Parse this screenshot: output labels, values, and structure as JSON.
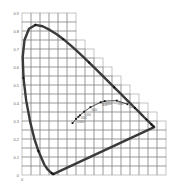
{
  "chart_data": {
    "type": "line",
    "xlabel": "x",
    "ylabel": "y",
    "xlim": [
      0,
      0.8
    ],
    "ylim": [
      0,
      0.9
    ],
    "grid": true,
    "y_ticks": [
      "0",
      "0.1",
      "0.2",
      "0.3",
      "0.4",
      "0.5",
      "0.6",
      "0.7",
      "0.8",
      "0.9"
    ],
    "x_ticks": [
      "0"
    ],
    "series": [
      {
        "name": "Spectral locus",
        "points": [
          [
            0.1741,
            0.005
          ],
          [
            0.173,
            0.0048
          ],
          [
            0.1714,
            0.0051
          ],
          [
            0.1689,
            0.0069
          ],
          [
            0.1644,
            0.0109
          ],
          [
            0.1566,
            0.0177
          ],
          [
            0.144,
            0.0297
          ],
          [
            0.1241,
            0.0578
          ],
          [
            0.0913,
            0.1327
          ],
          [
            0.0687,
            0.2007
          ],
          [
            0.0454,
            0.295
          ],
          [
            0.0235,
            0.4127
          ],
          [
            0.0082,
            0.5384
          ],
          [
            0.0039,
            0.6548
          ],
          [
            0.0139,
            0.7502
          ],
          [
            0.0389,
            0.812
          ],
          [
            0.0743,
            0.8338
          ],
          [
            0.1142,
            0.8262
          ],
          [
            0.1547,
            0.8059
          ],
          [
            0.1929,
            0.7816
          ],
          [
            0.2296,
            0.7543
          ],
          [
            0.2658,
            0.7243
          ],
          [
            0.3016,
            0.6923
          ],
          [
            0.3373,
            0.6589
          ],
          [
            0.3731,
            0.6245
          ],
          [
            0.4087,
            0.5896
          ],
          [
            0.4441,
            0.5547
          ],
          [
            0.4788,
            0.5202
          ],
          [
            0.5125,
            0.4866
          ],
          [
            0.5448,
            0.4544
          ],
          [
            0.5752,
            0.4242
          ],
          [
            0.6029,
            0.3965
          ],
          [
            0.627,
            0.3725
          ],
          [
            0.6482,
            0.3514
          ],
          [
            0.6658,
            0.334
          ],
          [
            0.6801,
            0.3197
          ],
          [
            0.6915,
            0.3083
          ],
          [
            0.7006,
            0.2993
          ],
          [
            0.7079,
            0.292
          ],
          [
            0.714,
            0.2859
          ],
          [
            0.719,
            0.2809
          ],
          [
            0.723,
            0.277
          ],
          [
            0.726,
            0.274
          ],
          [
            0.7283,
            0.2717
          ],
          [
            0.73,
            0.27
          ],
          [
            0.7347,
            0.2653
          ]
        ],
        "closed_with_purple_line": true
      },
      {
        "name": "Planckian locus",
        "points": [
          [
            0.2806,
            0.2883
          ],
          [
            0.3003,
            0.3117
          ],
          [
            0.3135,
            0.3236
          ],
          [
            0.3221,
            0.3318
          ],
          [
            0.3451,
            0.3516
          ],
          [
            0.3805,
            0.3768
          ],
          [
            0.4369,
            0.4041
          ],
          [
            0.4596,
            0.4105
          ],
          [
            0.5267,
            0.4133
          ],
          [
            0.5857,
            0.3931
          ]
        ],
        "labels": [
          "",
          "10000",
          "",
          "6000",
          "5000",
          "4000",
          "3000",
          "2500",
          "2000",
          "1500"
        ]
      }
    ]
  },
  "axes": {
    "y_labels": [
      "0",
      "0.1",
      "0.2",
      "0.3",
      "0.4",
      "0.5",
      "0.6",
      "0.7",
      "0.8",
      "0.9"
    ],
    "x_origin_label": "0"
  },
  "colors": {
    "grid": "#8a8a8a",
    "locus": "#3a3a3a",
    "planck": "#3a3a3a",
    "label": "#666666",
    "background": "#ffffff"
  }
}
